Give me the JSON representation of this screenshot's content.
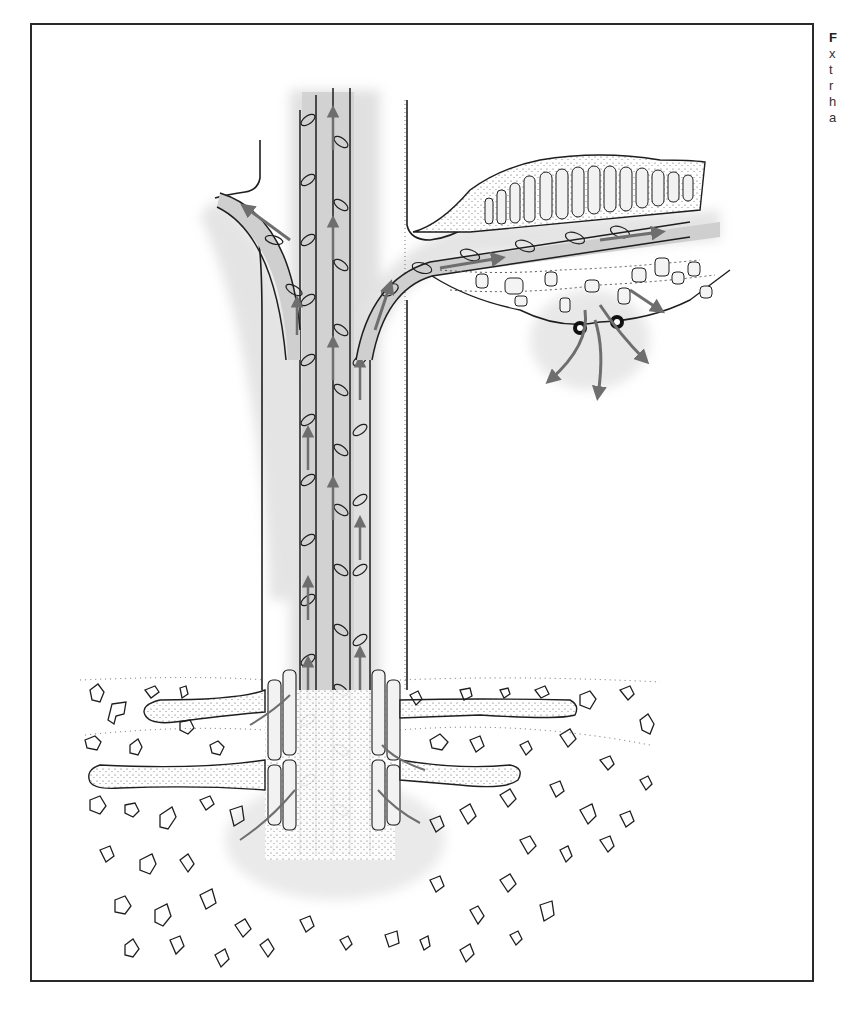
{
  "figure": {
    "type": "scientific illustration",
    "frame": {
      "left": 30,
      "top": 23,
      "right": 816,
      "bottom": 984
    },
    "colors": {
      "outline": "#1e1e1e",
      "tissue_shading": "#cfcfcf",
      "flow_arrow": "#6e6e6e",
      "stipple": "#555555",
      "background": "#ffffff"
    },
    "regions": [
      {
        "name": "main-stem",
        "description": "central bundle of conducting tubes with upward arrows"
      },
      {
        "name": "left-branch",
        "description": "branch curving up-left with arrow"
      },
      {
        "name": "right-branch",
        "description": "branch curving right into leaf-like tissue"
      },
      {
        "name": "leaf-tissue",
        "description": "palisade cells with stipple above, spongy cells below"
      },
      {
        "name": "stomata",
        "description": "two dark pores with arrows exiting downward"
      },
      {
        "name": "root-zone",
        "description": "root hairs and tubes among soil particles"
      },
      {
        "name": "soil-particles",
        "description": "irregular outlined particles"
      }
    ]
  },
  "caption": {
    "visible_fragments": [
      "F",
      "x",
      "t",
      "r",
      "h",
      "a"
    ]
  }
}
